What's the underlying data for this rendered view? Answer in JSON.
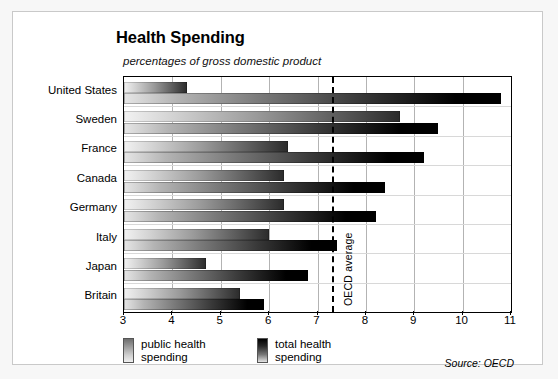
{
  "card": {
    "source_note": "Source: OECD"
  },
  "legend": {
    "items": [
      {
        "label_line1": "public health",
        "label_line2": "spending",
        "key": "public"
      },
      {
        "label_line1": "total health",
        "label_line2": "spending",
        "key": "total"
      }
    ]
  },
  "annotations": {
    "oecd_average_label": "OECD average",
    "oecd_average_value": 7.3
  },
  "chart_data": {
    "type": "bar",
    "orientation": "horizontal",
    "title": "Health Spending",
    "subtitle": "percentages of gross domestic product",
    "xlabel": "",
    "ylabel": "",
    "xlim": [
      3,
      11
    ],
    "xticks": [
      3,
      4,
      5,
      6,
      7,
      8,
      9,
      10,
      11
    ],
    "xtick_labels": [
      "3",
      "4",
      "5",
      "6",
      "7",
      "8",
      "9",
      "10",
      "11"
    ],
    "grid": true,
    "legend_position": "bottom-left",
    "categories": [
      "United States",
      "Sweden",
      "France",
      "Canada",
      "Germany",
      "Italy",
      "Japan",
      "Britain"
    ],
    "series": [
      {
        "name": "public health spending",
        "values": [
          4.3,
          8.7,
          6.4,
          6.3,
          6.3,
          6.0,
          4.7,
          5.4
        ]
      },
      {
        "name": "total health spending",
        "values": [
          10.8,
          9.5,
          9.2,
          8.4,
          8.2,
          7.4,
          6.8,
          5.9
        ]
      }
    ],
    "reference_line": {
      "label": "OECD average",
      "value": 7.3,
      "style": "dashed"
    },
    "source": "Source: OECD"
  }
}
